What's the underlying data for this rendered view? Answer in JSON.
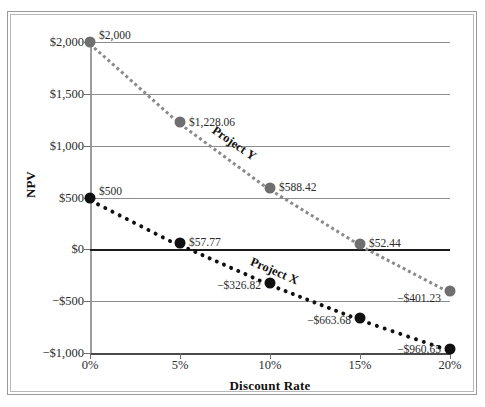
{
  "chart_data": {
    "type": "line",
    "title": "",
    "xlabel": "Discount Rate",
    "ylabel": "NPV",
    "x": [
      0,
      5,
      10,
      15,
      20
    ],
    "categories": [
      "0%",
      "5%",
      "10%",
      "15%",
      "20%"
    ],
    "xtick_labels": [
      "0%",
      "5%",
      "10%",
      "15%",
      "20%"
    ],
    "ytick_labels": [
      "$2,000",
      "$1,500",
      "$1,000",
      "$500",
      "$0",
      "−$500",
      "−$1,000"
    ],
    "ytick_values": [
      2000,
      1500,
      1000,
      500,
      0,
      -500,
      -1000
    ],
    "ylim": [
      -1000,
      2000
    ],
    "xlim": [
      0,
      20
    ],
    "grid": true,
    "legend": "inline-annotations",
    "series": [
      {
        "name": "Project Y",
        "color": "#8a8a8a",
        "marker_color": "#6f6f6f",
        "linestyle": "dotted",
        "values": [
          2000,
          1228.06,
          588.42,
          52.44,
          -401.23
        ],
        "point_labels": [
          "$2,000",
          "$1,228.06",
          "$588.42",
          "$52.44",
          "−$401.23"
        ]
      },
      {
        "name": "Project X",
        "color": "#111111",
        "marker_color": "#111111",
        "linestyle": "dotted",
        "values": [
          500,
          57.77,
          -326.82,
          -663.68,
          -960.65
        ],
        "point_labels": [
          "$500",
          "$57.77",
          "−$326.82",
          "−$663.68",
          "−$960.65"
        ]
      }
    ],
    "annotations": [
      {
        "text": "Project Y",
        "series": "Project Y"
      },
      {
        "text": "Project X",
        "series": "Project X"
      }
    ]
  }
}
